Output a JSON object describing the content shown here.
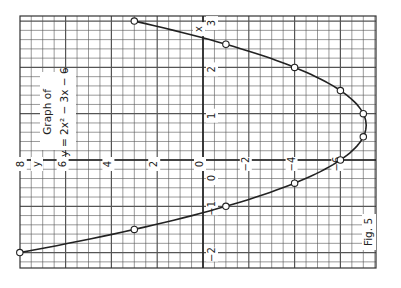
{
  "chart_data": {
    "type": "line",
    "title": "Graph of y = 2x² − 3x − 6",
    "title_lines": [
      "Graph of",
      "y = 2x² − 3x − 6"
    ],
    "figure_label": "Fig. 5",
    "orientation": "rotated 90° counter-clockwise (y-axis horizontal, x-axis vertical)",
    "xlabel": "x",
    "ylabel": "y",
    "x": [
      -2,
      -1.5,
      -1,
      -0.5,
      0,
      0.5,
      1,
      1.5,
      2,
      2.5,
      3
    ],
    "series": [
      {
        "name": "y = 2x² − 3x − 6",
        "values": [
          8,
          3,
          -1,
          -4,
          -6,
          -7,
          -7,
          -6,
          -4,
          -1,
          3
        ]
      }
    ],
    "xlim": [
      -2,
      3
    ],
    "ylim": [
      -7.5,
      8
    ],
    "x_ticks": [
      3,
      2,
      1,
      0,
      -1,
      -2
    ],
    "y_ticks": [
      8,
      6,
      4,
      2,
      0,
      -2,
      -4,
      -6
    ],
    "grid": true,
    "markers": "circles"
  },
  "labels": {
    "title_line1": "Graph of",
    "title_line2": "y = 2x² − 3x − 6",
    "fig": "Fig. 5",
    "x_axis": "x",
    "y_axis": "y"
  },
  "colors": {
    "ink": "#222222",
    "grid": "#555555",
    "paper": "#ffffff"
  }
}
